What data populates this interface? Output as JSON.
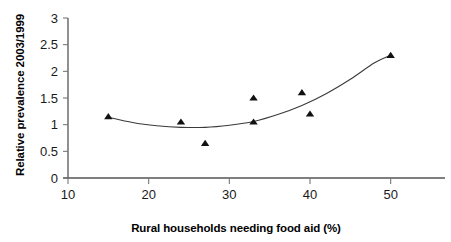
{
  "chart_data": {
    "type": "scatter",
    "title": "",
    "xlabel": "Rural households needing food aid (%)",
    "ylabel": "Relative prevalence 2003/1999",
    "xlim": [
      10,
      55
    ],
    "ylim": [
      0,
      3
    ],
    "xticks": [
      10,
      20,
      30,
      40,
      50
    ],
    "xtick_labels": [
      "10",
      "20",
      "30",
      "40",
      "50"
    ],
    "yticks": [
      0,
      0.5,
      1,
      1.5,
      2,
      2.5,
      3
    ],
    "ytick_labels": [
      "0",
      "0.5",
      "1",
      "1.5",
      "2",
      "2.5",
      "3"
    ],
    "grid": false,
    "legend": null,
    "marker": "triangle",
    "marker_color": "#111111",
    "points": [
      {
        "x": 15,
        "y": 1.15
      },
      {
        "x": 24,
        "y": 1.05
      },
      {
        "x": 27,
        "y": 0.65
      },
      {
        "x": 33,
        "y": 1.5
      },
      {
        "x": 33,
        "y": 1.05
      },
      {
        "x": 39,
        "y": 1.6
      },
      {
        "x": 40,
        "y": 1.2
      },
      {
        "x": 50,
        "y": 2.3
      }
    ],
    "fit_curve": {
      "name": "fitted trend",
      "color": "#3a3a3a",
      "x": [
        15,
        18,
        21,
        24,
        27,
        30,
        33,
        36,
        39,
        42,
        45,
        48,
        50
      ],
      "y": [
        1.14,
        1.04,
        0.98,
        0.95,
        0.95,
        0.99,
        1.06,
        1.19,
        1.36,
        1.58,
        1.85,
        2.16,
        2.3
      ]
    }
  },
  "axis": {
    "x_title": "Rural households needing food aid (%)",
    "y_title": "Relative prevalence 2003/1999"
  }
}
